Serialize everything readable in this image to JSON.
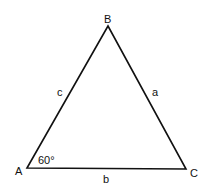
{
  "diagram": {
    "type": "triangle",
    "vertices": {
      "A": {
        "label": "A",
        "x": 27,
        "y": 168
      },
      "B": {
        "label": "B",
        "x": 108,
        "y": 26
      },
      "C": {
        "label": "C",
        "x": 186,
        "y": 169
      }
    },
    "sides": {
      "a": {
        "label": "a",
        "between": [
          "B",
          "C"
        ]
      },
      "b": {
        "label": "b",
        "between": [
          "A",
          "C"
        ]
      },
      "c": {
        "label": "c",
        "between": [
          "A",
          "B"
        ]
      }
    },
    "angle_A": {
      "label": "60°"
    },
    "stroke_color": "#111111"
  }
}
